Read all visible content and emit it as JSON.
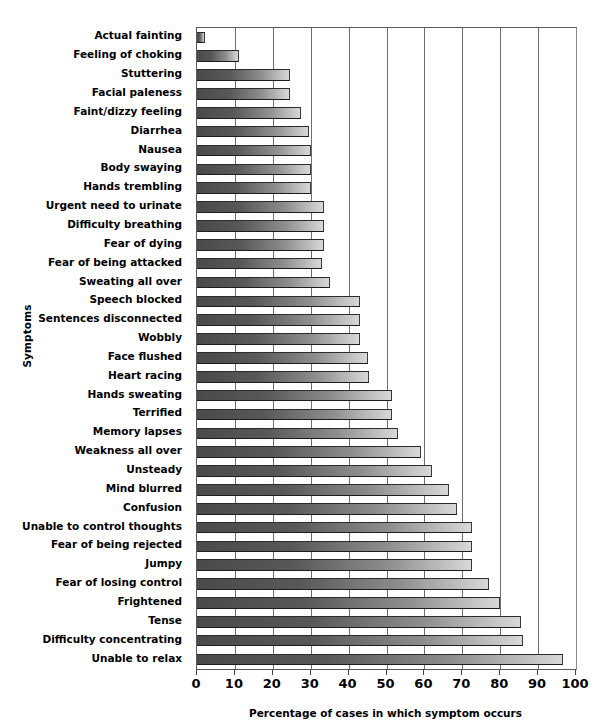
{
  "chart_data": {
    "type": "bar",
    "orientation": "horizontal",
    "title": "",
    "xlabel": "Percentage of cases in which symptom occurs",
    "ylabel": "Symptoms",
    "xlim": [
      0,
      100
    ],
    "xticks": [
      0,
      10,
      20,
      30,
      40,
      50,
      60,
      70,
      80,
      90,
      100
    ],
    "grid": "vertical",
    "legend": "none",
    "categories": [
      "Actual fainting",
      "Feeling of choking",
      "Stuttering",
      "Facial paleness",
      "Faint/dizzy feeling",
      "Diarrhea",
      "Nausea",
      "Body swaying",
      "Hands trembling",
      "Urgent need to urinate",
      "Difficulty breathing",
      "Fear of dying",
      "Fear of being attacked",
      "Sweating all over",
      "Speech blocked",
      "Sentences disconnected",
      "Wobbly",
      "Face flushed",
      "Heart racing",
      "Hands sweating",
      "Terrified",
      "Memory lapses",
      "Weakness all over",
      "Unsteady",
      "Mind blurred",
      "Confusion",
      "Unable to control thoughts",
      "Fear of being rejected",
      "Jumpy",
      "Fear of losing control",
      "Frightened",
      "Tense",
      "Difficulty concentrating",
      "Unable to relax"
    ],
    "values": [
      2,
      11,
      24.5,
      24.5,
      27.5,
      29.5,
      30,
      30,
      30,
      33.5,
      33.5,
      33.5,
      33,
      35,
      43,
      43,
      43,
      45,
      45.5,
      51.5,
      51.5,
      53,
      59,
      62,
      66.5,
      68.5,
      72.5,
      72.5,
      72.5,
      77,
      80,
      85.5,
      86,
      96.5
    ],
    "bar_fill": "#6e6e6e",
    "bar_edge": "#2c2c2c",
    "grid_color": "#6e6e6e",
    "background": "#ffffff"
  }
}
